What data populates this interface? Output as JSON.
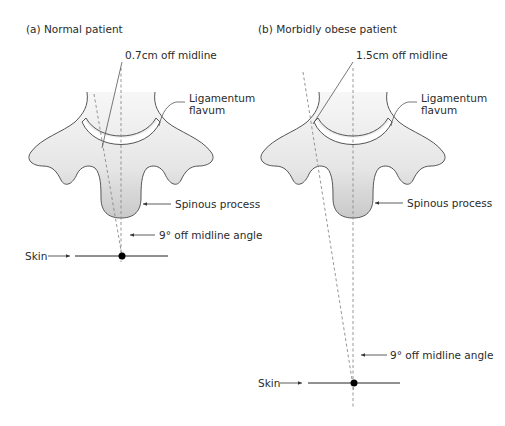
{
  "panels": [
    {
      "title": "(a) Normal patient",
      "offset_label": "0.7cm off midline",
      "ligamentum_label_line1": "Ligamentum",
      "ligamentum_label_line2": "flavum",
      "spinous_label": "Spinous process",
      "angle_label": "9° off midline angle",
      "skin_label": "Skin"
    },
    {
      "title": "(b) Morbidly obese patient",
      "offset_label": "1.5cm off midline",
      "ligamentum_label_line1": "Ligamentum",
      "ligamentum_label_line2": "flavum",
      "spinous_label": "Spinous process",
      "angle_label": "9° off midline angle",
      "skin_label": "Skin"
    }
  ],
  "colors": {
    "bone_fill_light": "#f4f4f4",
    "bone_fill_dark": "#cfcfcf",
    "outline": "#555555",
    "text": "#2b2b2b",
    "dashed": "#9a9a9a"
  }
}
